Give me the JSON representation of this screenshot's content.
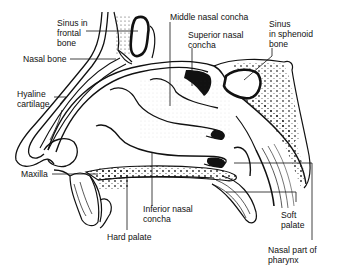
{
  "diagram": {
    "labels": {
      "sinus_frontal": "Sinus in\nfrontal\nbone",
      "nasal_bone": "Nasal bone",
      "hyaline_cartilage": "Hyaline\ncartilage",
      "maxilla": "Maxilla",
      "hard_palate": "Hard palate",
      "inferior_concha": "Inferior nasal\nconcha",
      "middle_concha": "Middle nasal concha",
      "superior_concha": "Superior nasal\nconcha",
      "sinus_sphenoid": "Sinus\nin sphenoid\nbone",
      "soft_palate": "Soft\npalate",
      "nasal_pharynx": "Nasal part of\npharynx"
    },
    "colors": {
      "ink": "#111111",
      "background": "#ffffff",
      "stipple": "#555555"
    }
  }
}
